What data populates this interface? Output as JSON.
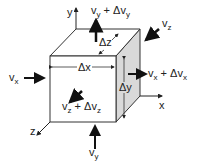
{
  "diagram": {
    "labels": {
      "y_axis": "y",
      "x_axis": "x",
      "z_axis": "z",
      "vy_out": {
        "base": "v",
        "sub": "y",
        "plus": " + Δv",
        "sub2": "y"
      },
      "vz_in": {
        "base": "v",
        "sub": "z"
      },
      "vx_in": {
        "base": "v",
        "sub": "x"
      },
      "vx_out": {
        "base": "v",
        "sub": "x",
        "plus": " + Δv",
        "sub2": "x"
      },
      "vz_out": {
        "base": "v",
        "sub": "z",
        "plus": " + Δv",
        "sub2": "z"
      },
      "vy_in": {
        "base": "v",
        "sub": "y"
      },
      "dx": "Δx",
      "dy": "Δy",
      "dz": "Δz"
    },
    "colors": {
      "line": "#333333",
      "shade": "#d9d9d9"
    }
  }
}
